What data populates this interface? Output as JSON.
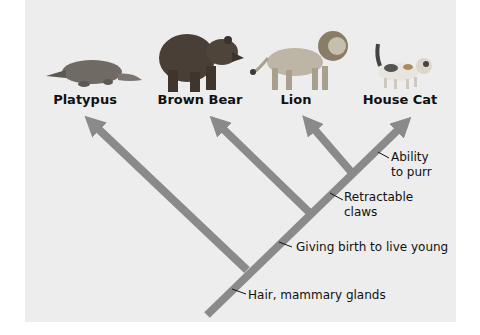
{
  "diagram": {
    "type": "cladogram",
    "colors": {
      "panel_background": "#ededed",
      "branch": "#8a8a8a",
      "text": "#111111"
    },
    "taxa": [
      {
        "id": "platypus",
        "label": "Platypus"
      },
      {
        "id": "brown-bear",
        "label": "Brown Bear"
      },
      {
        "id": "lion",
        "label": "Lion"
      },
      {
        "id": "house-cat",
        "label": "House Cat"
      }
    ],
    "traits": [
      {
        "id": "hair",
        "label": "Hair, mammary glands"
      },
      {
        "id": "live-birth",
        "label": "Giving birth to live young"
      },
      {
        "id": "claws",
        "label_line1": "Retractable",
        "label_line2": "claws"
      },
      {
        "id": "purr",
        "label_line1": "Ability",
        "label_line2": "to purr"
      }
    ]
  }
}
